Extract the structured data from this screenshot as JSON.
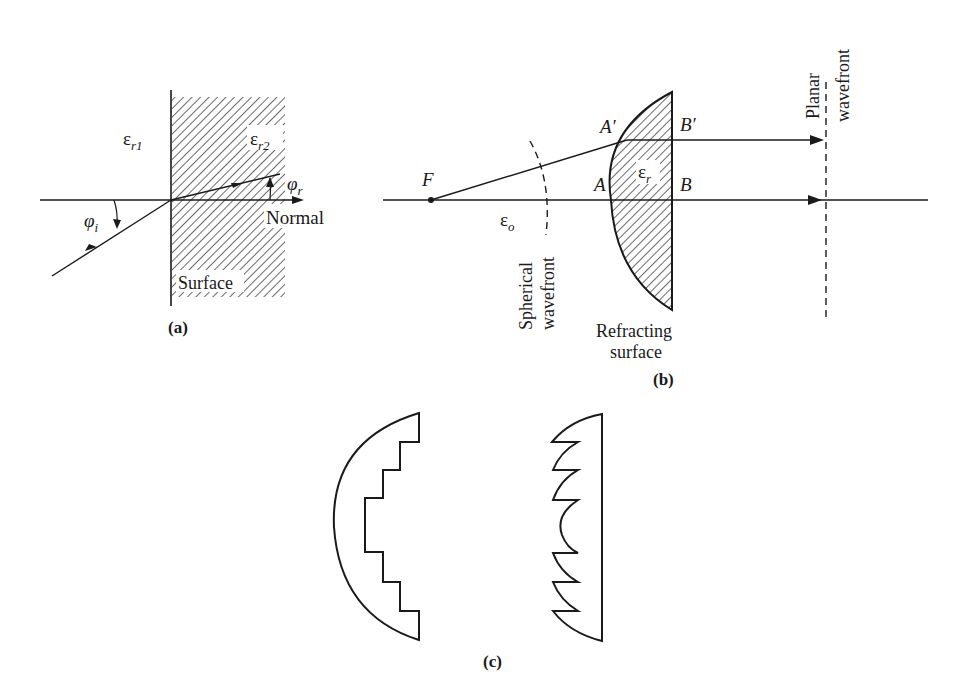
{
  "figure": {
    "panel_a": {
      "caption": "(a)",
      "eps_left": "ε",
      "eps_left_sub": "r1",
      "eps_right": "ε",
      "eps_right_sub": "r2",
      "phi_i": "φ",
      "phi_i_sub": "i",
      "phi_r": "φ",
      "phi_r_sub": "r",
      "normal_label": "Normal",
      "surface_label": "Surface"
    },
    "panel_b": {
      "caption": "(b)",
      "focus_label": "F",
      "eps_o": "ε",
      "eps_o_sub": "o",
      "eps_r": "ε",
      "eps_r_sub": "r",
      "point_a": "A",
      "point_a_prime": "A′",
      "point_b": "B",
      "point_b_prime": "B′",
      "spherical_line1": "Spherical",
      "spherical_line2": "wavefront",
      "planar_line1": "Planar",
      "planar_line2": "wavefront",
      "refracting_line1": "Refracting",
      "refracting_line2": "surface"
    },
    "panel_c": {
      "caption": "(c)"
    }
  },
  "colors": {
    "ink": "#1a1a1a",
    "background": "#ffffff"
  }
}
